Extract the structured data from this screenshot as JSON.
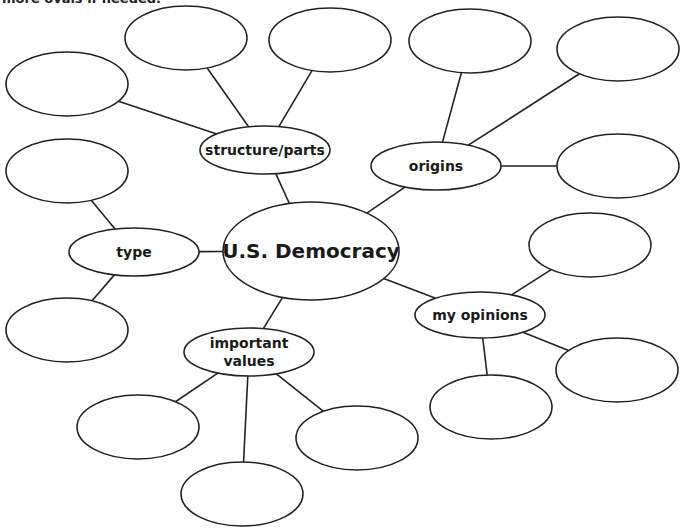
{
  "header_text": "more ovals if needed.",
  "center": {
    "id": "center",
    "label": "U.S. Democracy"
  },
  "categories": [
    {
      "id": "structure",
      "label": "structure/parts"
    },
    {
      "id": "origins",
      "label": "origins"
    },
    {
      "id": "type",
      "label": "type"
    },
    {
      "id": "opinions",
      "label": "my opinions"
    },
    {
      "id": "values",
      "label": "important values",
      "lines": [
        "important",
        "values"
      ]
    }
  ],
  "blank_oval_counts": {
    "structure": 3,
    "origins": 3,
    "type": 2,
    "opinions": 3,
    "values": 3
  }
}
